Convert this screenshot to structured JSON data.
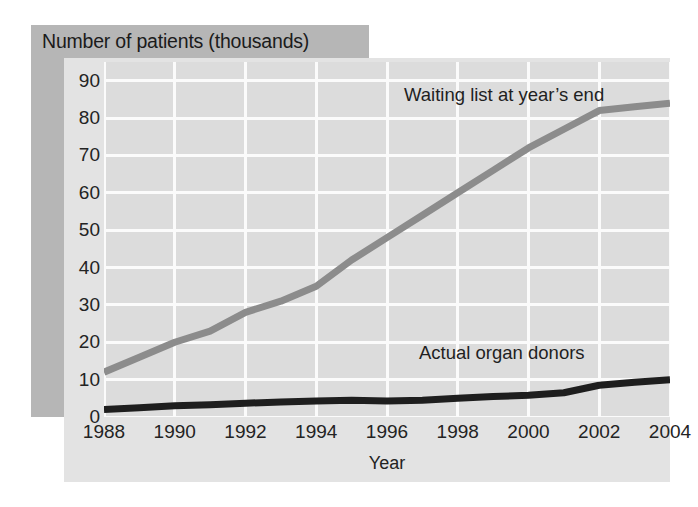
{
  "figure": {
    "title": "Number of patients (thousands)",
    "xaxis_title": "Year",
    "colors": {
      "banner": "#b6b6b6",
      "panel": "#e3e3e3",
      "plot": "#dcdcdc",
      "gridline": "#fbfbfb",
      "waiting_list_series": "#8c8c8c",
      "donors_series": "#1e1e1e",
      "text": "#232323"
    },
    "labels": {
      "waiting": "Waiting list at year’s end",
      "donors": "Actual organ donors"
    }
  },
  "chart_data": {
    "type": "line",
    "title": "Number of patients (thousands)",
    "subtitle": "",
    "xlabel": "Year",
    "ylabel": "Number of patients (thousands)",
    "x": [
      1988,
      1989,
      1990,
      1991,
      1992,
      1993,
      1994,
      1995,
      1996,
      1997,
      1998,
      1999,
      2000,
      2001,
      2002,
      2003,
      2004
    ],
    "xtick_labels": [
      "1988",
      "1990",
      "1992",
      "1994",
      "1996",
      "1998",
      "2000",
      "2002",
      "2004"
    ],
    "xtick_values": [
      1988,
      1990,
      1992,
      1994,
      1996,
      1998,
      2000,
      2002,
      2004
    ],
    "ytick_labels": [
      "0",
      "10",
      "20",
      "30",
      "40",
      "50",
      "60",
      "70",
      "80",
      "90"
    ],
    "ytick_values": [
      0,
      10,
      20,
      30,
      40,
      50,
      60,
      70,
      80,
      90
    ],
    "xlim": [
      1988,
      2004
    ],
    "ylim": [
      0,
      95
    ],
    "grid": true,
    "legend_position": "inline-annotation",
    "series": [
      {
        "name": "Waiting list at year’s end",
        "color": "#8c8c8c",
        "values": [
          12,
          16,
          20,
          23,
          28,
          31,
          35,
          42,
          48,
          54,
          60,
          66,
          72,
          77,
          82,
          83,
          84
        ]
      },
      {
        "name": "Actual organ donors",
        "color": "#1e1e1e",
        "values": [
          2,
          2.5,
          3,
          3.3,
          3.7,
          4,
          4.3,
          4.5,
          4.3,
          4.5,
          5,
          5.5,
          5.8,
          6.5,
          8.5,
          9.3,
          10
        ]
      }
    ],
    "annotations": [
      {
        "text": "Waiting list at year’s end",
        "x": 1997,
        "y": 89
      },
      {
        "text": "Actual organ donors",
        "x": 1997.5,
        "y": 16
      }
    ]
  }
}
